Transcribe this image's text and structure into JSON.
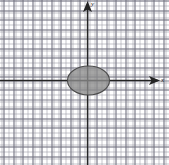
{
  "figure": {
    "name": "coordinate-plane-with-shaded-ellipse",
    "width": 169,
    "height": 165,
    "background_color": "#ffffff"
  },
  "axes": {
    "x_axis_label": "x",
    "y_axis_label": "y",
    "axis_color": "#242424",
    "origin_px": {
      "x": 87.5,
      "y": 80.5
    },
    "x_axis_y_px": 80.5,
    "y_axis_x_px": 87.5,
    "x_arrow_direction": "right",
    "y_arrow_direction": "up"
  },
  "grid": {
    "visible": true,
    "style": "graph-paper",
    "minor_spacing_px": 2.375,
    "major_spacing_px": 9.5,
    "minor_color": "#96969f",
    "major_color": "#6e6e7d"
  },
  "chart_data": {
    "type": "scatter",
    "title": "",
    "xlabel": "x",
    "ylabel": "y",
    "grid": true,
    "legend": "none",
    "xlim": [
      -9.2,
      8.6
    ],
    "ylim": [
      -8.9,
      8.5
    ],
    "x_tick_interval": 1,
    "y_tick_interval": 1,
    "tick_labels_shown": false,
    "annotations": [],
    "shapes": [
      {
        "kind": "ellipse",
        "label": "shaded-ellipse",
        "center": {
          "x": 0,
          "y": 0
        },
        "semi_axis_x": 2.2,
        "semi_axis_y": 1.5,
        "center_px": {
          "x": 88.5,
          "y": 80.5
        },
        "radius_x_px": 21,
        "radius_y_px": 14.5,
        "fill_color": "#8c8c8c",
        "fill_opacity": 0.78,
        "stroke_color": "#4a4a4a",
        "shaded": true
      }
    ]
  }
}
